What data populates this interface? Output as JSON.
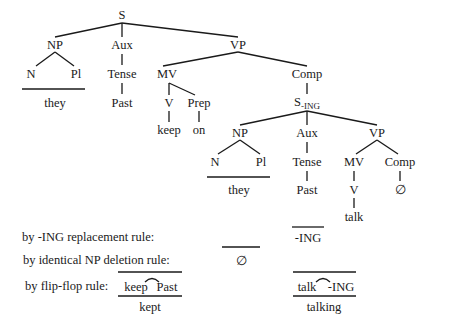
{
  "tree": {
    "S": "S",
    "NP": "NP",
    "Aux": "Aux",
    "VP": "VP",
    "N": "N",
    "Pl": "Pl",
    "they": "they",
    "Tense": "Tense",
    "Past": "Past",
    "MV": "MV",
    "Comp": "Comp",
    "V": "V",
    "Prep": "Prep",
    "keep": "keep",
    "on": "on",
    "S_ING_main": "S",
    "S_ING_sub": "-ING",
    "embedded": {
      "NP": "NP",
      "Aux": "Aux",
      "VP": "VP",
      "N": "N",
      "Pl": "Pl",
      "they": "they",
      "Tense": "Tense",
      "Past": "Past",
      "MV": "MV",
      "Comp": "Comp",
      "V": "V",
      "null": "∅",
      "talk": "talk"
    }
  },
  "rules": {
    "ing_replacement": {
      "label": "by -ING replacement rule:",
      "result": "-ING"
    },
    "np_deletion": {
      "label": "by identical NP deletion rule:",
      "result": "∅"
    },
    "flip_flop": {
      "label": "by flip-flop rule:",
      "left_input_a": "keep",
      "left_input_b": "Past",
      "left_output": "kept",
      "right_input_a": "talk",
      "right_input_b": "-ING",
      "right_output": "talking"
    }
  }
}
